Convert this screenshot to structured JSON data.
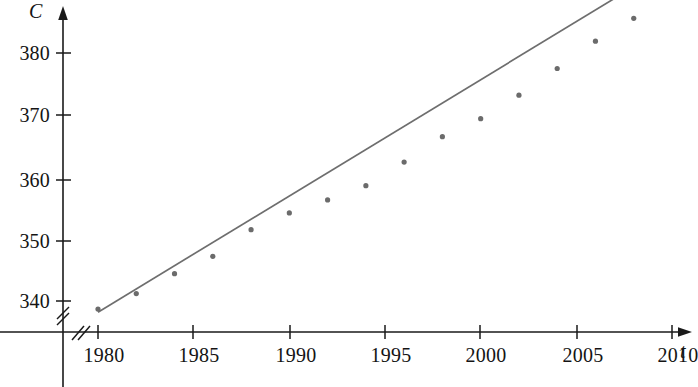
{
  "chart_data": {
    "type": "scatter",
    "title": "",
    "xlabel": "t",
    "ylabel": "C",
    "x": [
      1980,
      1982,
      1984,
      1986,
      1988,
      1990,
      1992,
      1994,
      1996,
      1998,
      2000,
      2002,
      2004,
      2006,
      2008
    ],
    "values": [
      338.7,
      341.2,
      344.4,
      347.2,
      351.5,
      354.2,
      356.3,
      358.6,
      362.4,
      366.5,
      369.4,
      373.2,
      377.5,
      381.9,
      385.6
    ],
    "series": [
      {
        "name": "CO2 concentration",
        "type": "scatter",
        "values": [
          338.7,
          341.2,
          344.4,
          347.2,
          351.5,
          354.2,
          356.3,
          358.6,
          362.4,
          366.5,
          369.4,
          373.2,
          377.5,
          381.9,
          385.6
        ]
      },
      {
        "name": "regression line",
        "type": "line",
        "endpoints": [
          [
            1980,
            338.2
          ],
          [
            2009.5,
            393.5
          ]
        ],
        "slope": 1.875,
        "intercept_year": 1980
      }
    ],
    "xlim": [
      1978.6,
      2011.5
    ],
    "ylim": [
      336.0,
      393.5
    ],
    "xticks": [
      1980,
      1985,
      1990,
      1995,
      2000,
      2005,
      2010
    ],
    "yticks": [
      340,
      350,
      360,
      370,
      380
    ],
    "xtick_labels": [
      "1980",
      "1985",
      "1990",
      "1995",
      "2000",
      "2005",
      "2010"
    ],
    "ytick_labels": [
      "340",
      "350",
      "360",
      "370",
      "380"
    ],
    "grid": false,
    "legend": "none",
    "axis_break_x": true,
    "axis_break_y": true,
    "marker_color": "#6b6b6b",
    "line_color": "#6e6e6e",
    "axis_color": "#1a1a1a"
  },
  "axes": {
    "y_axis_label": "C",
    "x_axis_label": "t"
  }
}
